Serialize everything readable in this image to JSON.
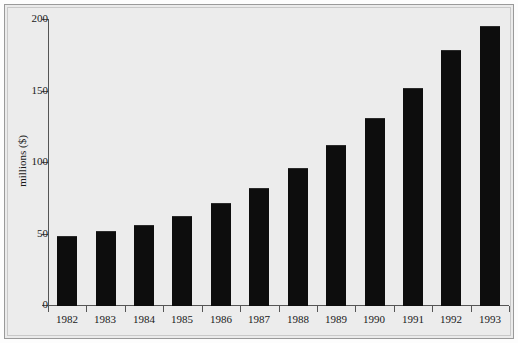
{
  "chart_data": {
    "type": "bar",
    "title": "",
    "subtitle": "",
    "xlabel": "",
    "ylabel": "millions ($)",
    "categories": [
      "1982",
      "1983",
      "1984",
      "1985",
      "1986",
      "1987",
      "1988",
      "1989",
      "1990",
      "1991",
      "1992",
      "1993"
    ],
    "values": [
      48,
      52,
      56,
      62,
      71,
      82,
      96,
      112,
      131,
      152,
      178,
      195
    ],
    "ylim": [
      0,
      200
    ],
    "yticks": [
      0,
      50,
      100,
      150,
      200
    ],
    "ytick_labels": [
      "0",
      "50",
      "100",
      "150",
      "200"
    ],
    "grid": false,
    "legend": null,
    "bar_color": "#0d0d0d",
    "background_color": "#ececec",
    "axis_color": "#555555",
    "frame_color": "#9a9a9a"
  }
}
